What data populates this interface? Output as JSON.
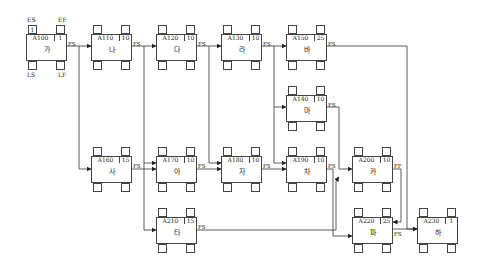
{
  "legend": {
    "es": "ES",
    "ef": "EF",
    "ls": "LS",
    "lf": "LF"
  },
  "nodes": [
    {
      "id": "A100",
      "dur": "1",
      "name": "가",
      "x": 26,
      "y": 25,
      "es": "1",
      "ef": "",
      "rel": "FS"
    },
    {
      "id": "A110",
      "dur": "10",
      "name": "나",
      "x": 91,
      "y": 25,
      "es": "",
      "ef": "",
      "rel": "FS"
    },
    {
      "id": "A120",
      "dur": "10",
      "name": "다",
      "x": 156,
      "y": 25,
      "es": "",
      "ef": "",
      "rel": "FS"
    },
    {
      "id": "A130",
      "dur": "10",
      "name": "라",
      "x": 221,
      "y": 25,
      "es": "",
      "ef": "",
      "rel": "FS"
    },
    {
      "id": "A150",
      "dur": "25",
      "name": "바",
      "x": 286,
      "y": 25,
      "es": "",
      "ef": "",
      "rel": "FS"
    },
    {
      "id": "A140",
      "dur": "10",
      "name": "마",
      "x": 286,
      "y": 86,
      "es": "",
      "ef": "",
      "rel": "FS"
    },
    {
      "id": "A160",
      "dur": "15",
      "name": "사",
      "x": 91,
      "y": 147,
      "es": "",
      "ef": "",
      "rel": "FS"
    },
    {
      "id": "A170",
      "dur": "10",
      "name": "아",
      "x": 156,
      "y": 147,
      "es": "",
      "ef": "",
      "rel": "FS"
    },
    {
      "id": "A180",
      "dur": "10",
      "name": "자",
      "x": 221,
      "y": 147,
      "es": "",
      "ef": "",
      "rel": "FS"
    },
    {
      "id": "A190",
      "dur": "10",
      "name": "차",
      "x": 286,
      "y": 147,
      "es": "",
      "ef": "",
      "rel": "FS"
    },
    {
      "id": "A200",
      "dur": "10",
      "name": "카",
      "x": 352,
      "y": 147,
      "es": "",
      "ef": "",
      "rel": "FF"
    },
    {
      "id": "A210",
      "dur": "15",
      "name": "타",
      "x": 156,
      "y": 208,
      "es": "",
      "ef": "",
      "rel": "FS"
    },
    {
      "id": "A220",
      "dur": "25",
      "name": "파",
      "x": 352,
      "y": 208,
      "es": "",
      "ef": "",
      "rel": "FS"
    },
    {
      "id": "A230",
      "dur": "1",
      "name": "하",
      "x": 417,
      "y": 208,
      "es": "",
      "ef": "",
      "rel": ""
    }
  ],
  "edges": [
    {
      "from": "A100",
      "to": "A110",
      "type": "FS",
      "points": [
        [
          67,
          46
        ],
        [
          91,
          46
        ]
      ]
    },
    {
      "from": "A100",
      "to": "A160",
      "type": "FS",
      "points": [
        [
          79,
          46
        ],
        [
          79,
          169
        ],
        [
          91,
          169
        ]
      ]
    },
    {
      "from": "A110",
      "to": "A120",
      "type": "FS",
      "points": [
        [
          132,
          46
        ],
        [
          156,
          46
        ]
      ]
    },
    {
      "from": "A110",
      "to": "A170",
      "type": "FS",
      "points": [
        [
          144,
          46
        ],
        [
          144,
          163
        ],
        [
          156,
          163
        ]
      ]
    },
    {
      "from": "A110",
      "to": "A210",
      "type": "FS",
      "points": [
        [
          144,
          163
        ],
        [
          144,
          230
        ],
        [
          156,
          230
        ]
      ]
    },
    {
      "from": "A120",
      "to": "A130",
      "type": "FS",
      "points": [
        [
          197,
          46
        ],
        [
          221,
          46
        ]
      ]
    },
    {
      "from": "A120",
      "to": "A180",
      "type": "FS",
      "points": [
        [
          209,
          46
        ],
        [
          209,
          163
        ],
        [
          221,
          163
        ]
      ]
    },
    {
      "from": "A130",
      "to": "A150",
      "type": "FS",
      "points": [
        [
          262,
          46
        ],
        [
          286,
          46
        ]
      ]
    },
    {
      "from": "A130",
      "to": "A140",
      "type": "FS",
      "points": [
        [
          274,
          46
        ],
        [
          274,
          107
        ],
        [
          286,
          107
        ]
      ]
    },
    {
      "from": "A130",
      "to": "A190",
      "type": "FS",
      "points": [
        [
          274,
          107
        ],
        [
          274,
          163
        ],
        [
          286,
          163
        ]
      ]
    },
    {
      "from": "A150",
      "to": "A230",
      "type": "FS",
      "points": [
        [
          327,
          46
        ],
        [
          407,
          46
        ],
        [
          407,
          229
        ],
        [
          417,
          229
        ]
      ]
    },
    {
      "from": "A140",
      "to": "A200",
      "type": "FS",
      "points": [
        [
          327,
          107
        ],
        [
          339,
          107
        ],
        [
          339,
          169
        ],
        [
          352,
          169
        ]
      ]
    },
    {
      "from": "A160",
      "to": "A170",
      "type": "FS",
      "points": [
        [
          132,
          169
        ],
        [
          156,
          169
        ]
      ]
    },
    {
      "from": "A170",
      "to": "A180",
      "type": "FS",
      "points": [
        [
          197,
          169
        ],
        [
          221,
          169
        ]
      ]
    },
    {
      "from": "A180",
      "to": "A190",
      "type": "FS",
      "points": [
        [
          262,
          169
        ],
        [
          286,
          169
        ]
      ]
    },
    {
      "from": "A190",
      "to": "A220",
      "type": "FS",
      "points": [
        [
          327,
          169
        ],
        [
          333,
          169
        ],
        [
          333,
          236
        ],
        [
          352,
          236
        ]
      ]
    },
    {
      "from": "A210",
      "to": "A220",
      "type": "FS",
      "points": [
        [
          197,
          230
        ],
        [
          336,
          230
        ],
        [
          336,
          181
        ],
        [
          339,
          177
        ]
      ]
    },
    {
      "from": "A200",
      "to": "A220",
      "type": "FF",
      "points": [
        [
          393,
          169
        ],
        [
          401,
          169
        ],
        [
          401,
          222
        ],
        [
          393,
          222
        ]
      ]
    },
    {
      "from": "A220",
      "to": "A230",
      "type": "FS",
      "points": [
        [
          393,
          229
        ],
        [
          417,
          229
        ]
      ]
    }
  ]
}
